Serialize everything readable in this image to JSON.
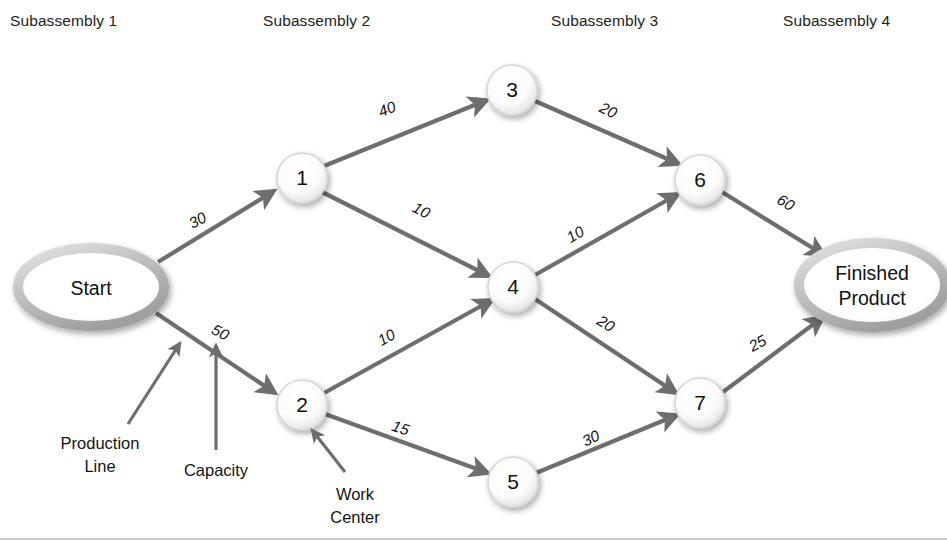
{
  "columns": [
    {
      "label": "Subassembly 1",
      "x": 10,
      "y": 26
    },
    {
      "label": "Subassembly 2",
      "x": 263,
      "y": 26
    },
    {
      "label": "Subassembly 3",
      "x": 551,
      "y": 26
    },
    {
      "label": "Subassembly 4",
      "x": 783,
      "y": 26
    }
  ],
  "terminals": [
    {
      "id": "start",
      "name": "start-node",
      "lines": [
        "Start"
      ],
      "cx": 91,
      "cy": 287,
      "rx": 73,
      "ry": 39
    },
    {
      "id": "finish",
      "name": "finished-product-node",
      "lines": [
        "Finished",
        "Product"
      ],
      "cx": 872,
      "cy": 285,
      "rx": 73,
      "ry": 42
    }
  ],
  "nodes": [
    {
      "id": "1",
      "label": "1",
      "cx": 302,
      "cy": 178,
      "r": 25
    },
    {
      "id": "2",
      "label": "2",
      "cx": 302,
      "cy": 405,
      "r": 25
    },
    {
      "id": "3",
      "label": "3",
      "cx": 512,
      "cy": 90,
      "r": 25
    },
    {
      "id": "4",
      "label": "4",
      "cx": 513,
      "cy": 287,
      "r": 25
    },
    {
      "id": "5",
      "label": "5",
      "cx": 513,
      "cy": 482,
      "r": 25
    },
    {
      "id": "6",
      "label": "6",
      "cx": 700,
      "cy": 180,
      "r": 25
    },
    {
      "id": "7",
      "label": "7",
      "cx": 700,
      "cy": 403,
      "r": 25
    }
  ],
  "edges": [
    {
      "from": "start",
      "to": "1",
      "capacity": "30",
      "lx": 200,
      "ly": 225,
      "rot": -28
    },
    {
      "from": "start",
      "to": "2",
      "capacity": "50",
      "lx": 218,
      "ly": 337,
      "rot": 27
    },
    {
      "from": "1",
      "to": "3",
      "capacity": "40",
      "lx": 389,
      "ly": 114,
      "rot": -22
    },
    {
      "from": "1",
      "to": "4",
      "capacity": "10",
      "lx": 419,
      "ly": 215,
      "rot": 27
    },
    {
      "from": "2",
      "to": "4",
      "capacity": "10",
      "lx": 389,
      "ly": 342,
      "rot": -29
    },
    {
      "from": "2",
      "to": "5",
      "capacity": "15",
      "lx": 399,
      "ly": 433,
      "rot": 18
    },
    {
      "from": "3",
      "to": "6",
      "capacity": "20",
      "lx": 606,
      "ly": 115,
      "rot": 26
    },
    {
      "from": "4",
      "to": "6",
      "capacity": "10",
      "lx": 578,
      "ly": 239,
      "rot": -30
    },
    {
      "from": "4",
      "to": "7",
      "capacity": "20",
      "lx": 603,
      "ly": 328,
      "rot": 32
    },
    {
      "from": "5",
      "to": "7",
      "capacity": "30",
      "lx": 593,
      "ly": 443,
      "rot": -25
    },
    {
      "from": "6",
      "to": "finish",
      "capacity": "60",
      "lx": 783,
      "ly": 207,
      "rot": 32
    },
    {
      "from": "7",
      "to": "finish",
      "capacity": "25",
      "lx": 760,
      "ly": 348,
      "rot": -28
    }
  ],
  "annotations": [
    {
      "id": "production-line",
      "lines": [
        "Production",
        "Line"
      ],
      "tx": 100,
      "ty": 443,
      "leader": {
        "x1": 128,
        "y1": 424,
        "x2": 180,
        "y2": 343
      }
    },
    {
      "id": "capacity",
      "lines": [
        "Capacity"
      ],
      "tx": 216,
      "ty": 470,
      "leader": {
        "x1": 216,
        "y1": 450,
        "x2": 216,
        "y2": 345
      }
    },
    {
      "id": "work-center",
      "lines": [
        "Work",
        "Center"
      ],
      "tx": 355,
      "ty": 495,
      "leader": {
        "x1": 345,
        "y1": 472,
        "x2": 312,
        "y2": 430
      }
    }
  ],
  "colors": {
    "edge": "#6e6e6e",
    "node_fill": "#ffffff",
    "node_rim": "#c4c4c4",
    "text": "#111111",
    "background": "#ffffff"
  }
}
